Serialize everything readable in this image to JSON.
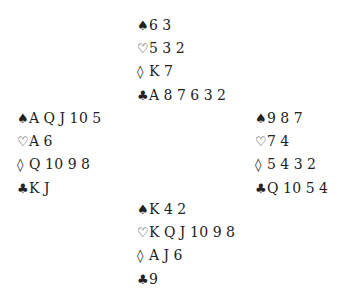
{
  "suits": {
    "spades": "♠",
    "hearts": "♡",
    "diamonds": "◊",
    "clubs": "♣"
  },
  "hands": {
    "north": {
      "spades": "6 3",
      "hearts": "5 3 2",
      "diamonds": "K 7",
      "clubs": "A 8 7 6 3 2"
    },
    "west": {
      "spades": "A Q J 10 5",
      "hearts": "A 6",
      "diamonds": "Q 10 9 8",
      "clubs": "K J"
    },
    "east": {
      "spades": "9 8 7",
      "hearts": "7 4",
      "diamonds": "5 4 3 2",
      "clubs": "Q 10 5 4"
    },
    "south": {
      "spades": "K 4 2",
      "hearts": "K Q J 10 9 8",
      "diamonds": "A J 6",
      "clubs": "9"
    }
  }
}
